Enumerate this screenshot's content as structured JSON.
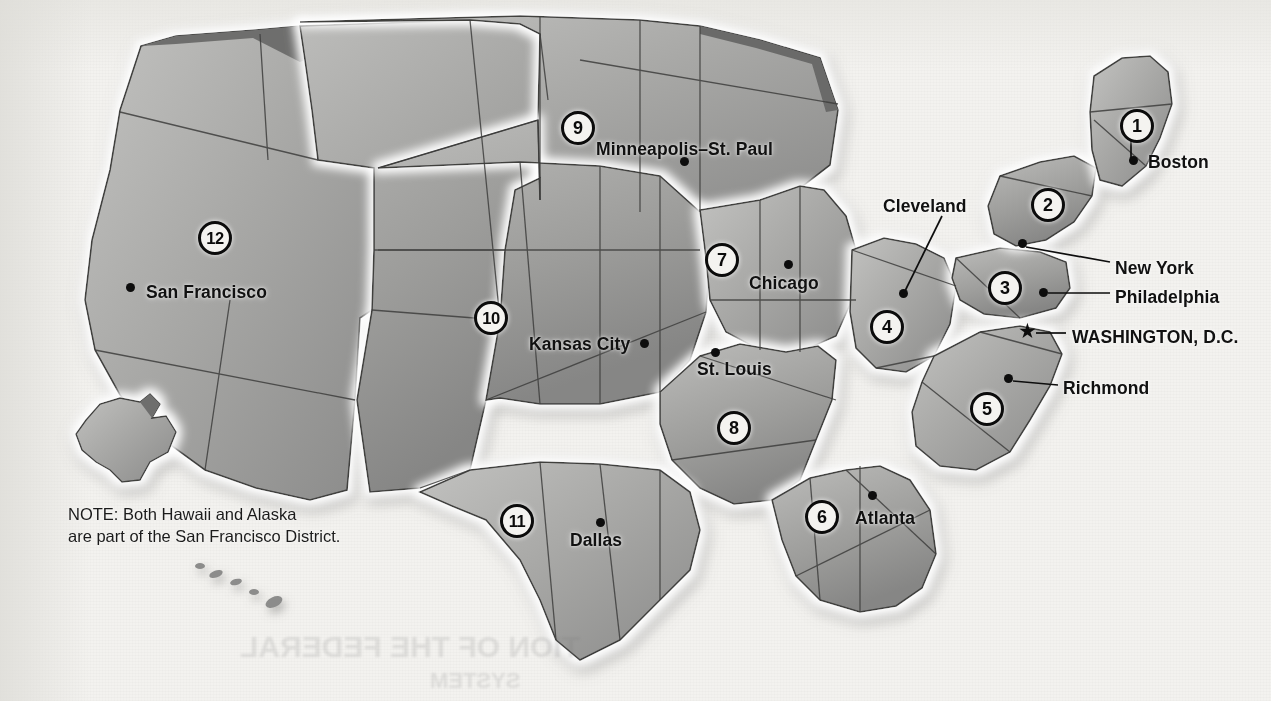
{
  "map": {
    "title": "Federal Reserve Districts",
    "note": "NOTE: Both Hawaii and Alaska\nare part of the San Francisco District.",
    "colors": {
      "background": "#f3f2ef",
      "land_light": "#b4b4b2",
      "land_dark": "#8d8d8c",
      "border": "#3a3a3a",
      "halo": "#ffffff",
      "ink": "#111111"
    },
    "districts": [
      {
        "number": "1",
        "x": 1137,
        "y": 126
      },
      {
        "number": "2",
        "x": 1048,
        "y": 205
      },
      {
        "number": "3",
        "x": 1005,
        "y": 288
      },
      {
        "number": "4",
        "x": 887,
        "y": 327
      },
      {
        "number": "5",
        "x": 987,
        "y": 409
      },
      {
        "number": "6",
        "x": 822,
        "y": 517
      },
      {
        "number": "7",
        "x": 722,
        "y": 260
      },
      {
        "number": "8",
        "x": 734,
        "y": 428
      },
      {
        "number": "9",
        "x": 578,
        "y": 128
      },
      {
        "number": "10",
        "x": 491,
        "y": 318
      },
      {
        "number": "11",
        "x": 517,
        "y": 521
      },
      {
        "number": "12",
        "x": 215,
        "y": 238
      }
    ],
    "cities": [
      {
        "name": "Boston",
        "dot_x": 1133,
        "dot_y": 160,
        "label_x": 1148,
        "label_y": 152,
        "leader": false,
        "marker": "dot"
      },
      {
        "name": "New York",
        "dot_x": 1022,
        "dot_y": 243,
        "label_x": 1115,
        "label_y": 258,
        "leader": true,
        "marker": "dot"
      },
      {
        "name": "Philadelphia",
        "dot_x": 1043,
        "dot_y": 292,
        "label_x": 1115,
        "label_y": 287,
        "leader": true,
        "marker": "dot"
      },
      {
        "name": "WASHINGTON, D.C.",
        "dot_x": 1028,
        "dot_y": 331,
        "label_x": 1072,
        "label_y": 327,
        "leader": true,
        "marker": "star"
      },
      {
        "name": "Richmond",
        "dot_x": 1008,
        "dot_y": 378,
        "label_x": 1063,
        "label_y": 378,
        "leader": true,
        "marker": "dot"
      },
      {
        "name": "Cleveland",
        "dot_x": 903,
        "dot_y": 293,
        "label_x": 883,
        "label_y": 196,
        "leader": true,
        "marker": "dot"
      },
      {
        "name": "Atlanta",
        "dot_x": 872,
        "dot_y": 495,
        "label_x": 855,
        "label_y": 508,
        "leader": false,
        "marker": "dot"
      },
      {
        "name": "Chicago",
        "dot_x": 788,
        "dot_y": 264,
        "label_x": 749,
        "label_y": 273,
        "leader": false,
        "marker": "dot"
      },
      {
        "name": "St. Louis",
        "dot_x": 715,
        "dot_y": 352,
        "label_x": 697,
        "label_y": 359,
        "leader": false,
        "marker": "dot"
      },
      {
        "name": "Minneapolis–St. Paul",
        "dot_x": 684,
        "dot_y": 161,
        "label_x": 596,
        "label_y": 139,
        "leader": false,
        "marker": "dot"
      },
      {
        "name": "Kansas City",
        "dot_x": 644,
        "dot_y": 343,
        "label_x": 529,
        "label_y": 334,
        "leader": false,
        "marker": "dot"
      },
      {
        "name": "Dallas",
        "dot_x": 600,
        "dot_y": 522,
        "label_x": 570,
        "label_y": 530,
        "leader": false,
        "marker": "dot"
      },
      {
        "name": "San Francisco",
        "dot_x": 130,
        "dot_y": 287,
        "label_x": 146,
        "label_y": 282,
        "leader": false,
        "marker": "dot"
      }
    ],
    "ghost_text": {
      "line1": "TION OF THE FEDERAL",
      "line2": "SYSTEM"
    }
  }
}
